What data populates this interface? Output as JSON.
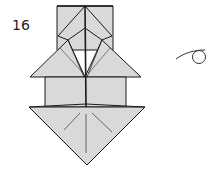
{
  "step": {
    "number": "16"
  },
  "symbols": {
    "turn_over": "turn-over-arrow"
  },
  "colors": {
    "paper": "#d9d9d9",
    "line": "#1a1a1a",
    "background": "#ffffff"
  }
}
